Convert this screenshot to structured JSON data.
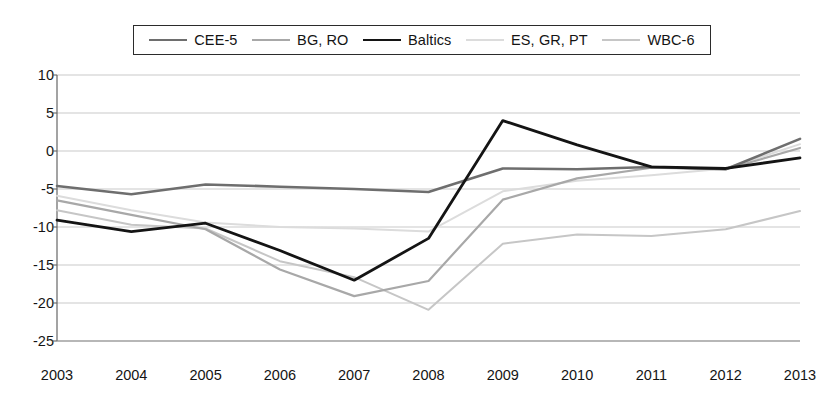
{
  "chart_data": {
    "type": "line",
    "title": "",
    "subtitle": "",
    "xlabel": "",
    "ylabel": "",
    "grid": true,
    "legend_position": "top",
    "categories": [
      "2003",
      "2004",
      "2005",
      "2006",
      "2007",
      "2008",
      "2009",
      "2010",
      "2011",
      "2012",
      "2013"
    ],
    "x": [
      2003,
      2004,
      2005,
      2006,
      2007,
      2008,
      2009,
      2010,
      2011,
      2012,
      2013
    ],
    "xlim": [
      2003,
      2013
    ],
    "ylim": [
      -25,
      10
    ],
    "ytick_labels": [
      "10",
      "5",
      "0",
      "-5",
      "-10",
      "-15",
      "-20",
      "-25"
    ],
    "yticks": [
      10,
      5,
      0,
      -5,
      -10,
      -15,
      -20,
      -25
    ],
    "series": [
      {
        "name": "CEE-5",
        "color": "#6e6e6e",
        "width": 2.6,
        "values": [
          -4.6,
          -5.7,
          -4.4,
          -4.7,
          -5.0,
          -5.4,
          -2.3,
          -2.4,
          -2.1,
          -2.4,
          1.6
        ]
      },
      {
        "name": "BG, RO",
        "color": "#a8a8a8",
        "width": 2.2,
        "values": [
          -6.5,
          -8.4,
          -10.3,
          -15.6,
          -19.1,
          -17.1,
          -6.4,
          -3.6,
          -2.2,
          -2.4,
          0.4
        ]
      },
      {
        "name": "Baltics",
        "color": "#141414",
        "width": 2.8,
        "values": [
          -9.1,
          -10.6,
          -9.5,
          -13.1,
          -17.0,
          -11.5,
          4.0,
          0.8,
          -2.1,
          -2.3,
          -0.9
        ]
      },
      {
        "name": "ES, GR, PT",
        "color": "#dcdcdc",
        "width": 2.0,
        "values": [
          -5.9,
          -7.8,
          -9.4,
          -10.0,
          -10.2,
          -10.6,
          -5.3,
          -3.9,
          -3.2,
          -2.3,
          0.9
        ]
      },
      {
        "name": "WBC-6",
        "color": "#c6c6c6",
        "width": 2.0,
        "values": [
          -7.8,
          -9.7,
          -10.2,
          -14.5,
          -16.6,
          -20.9,
          -12.2,
          -11.0,
          -11.2,
          -10.3,
          -7.9
        ]
      }
    ]
  },
  "legend": {
    "items": [
      {
        "label": "CEE-5"
      },
      {
        "label": "BG, RO"
      },
      {
        "label": "Baltics"
      },
      {
        "label": "ES, GR, PT"
      },
      {
        "label": "WBC-6"
      }
    ]
  }
}
